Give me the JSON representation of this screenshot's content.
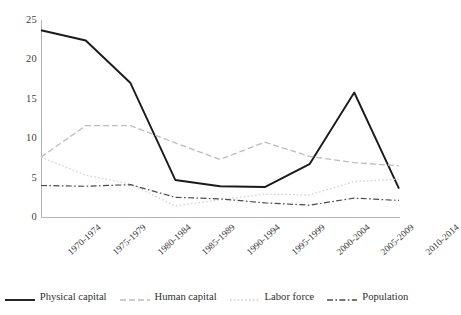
{
  "chart_data": {
    "type": "line",
    "title": "",
    "subtitle": "",
    "xlabel": "",
    "ylabel": "",
    "grid": false,
    "legend_position": "bottom",
    "ylim": [
      0,
      25
    ],
    "yticks": [
      0,
      5,
      10,
      15,
      20,
      25
    ],
    "categories": [
      "1970-1974",
      "1975-1979",
      "1980-1984",
      "1985-1989",
      "1990-1994",
      "1995-1999",
      "2000-2004",
      "2005-2009",
      "2010-2014"
    ],
    "series": [
      {
        "name": "Physical capital",
        "style": "solid",
        "color": "#1a1a1a",
        "width": 1.9,
        "values": [
          23.7,
          22.4,
          17.0,
          4.7,
          3.9,
          3.8,
          6.7,
          15.8,
          3.6
        ]
      },
      {
        "name": "Human capital",
        "style": "dashed",
        "color": "#bdbdbd",
        "width": 1.3,
        "values": [
          7.6,
          11.6,
          11.6,
          9.4,
          7.3,
          9.5,
          7.7,
          6.9,
          6.5
        ]
      },
      {
        "name": "Labor force",
        "style": "dotted",
        "color": "#cfcfcf",
        "width": 1.2,
        "values": [
          7.6,
          5.3,
          4.2,
          1.4,
          2.2,
          2.9,
          2.8,
          4.5,
          4.8
        ]
      },
      {
        "name": "Population",
        "style": "dash-dot",
        "color": "#4a4a4a",
        "width": 1.2,
        "values": [
          4.0,
          3.9,
          4.1,
          2.5,
          2.3,
          1.8,
          1.5,
          2.4,
          2.1
        ]
      }
    ]
  },
  "legend": {
    "items": [
      {
        "label": "Physical capital"
      },
      {
        "label": "Human capital"
      },
      {
        "label": "Labor force"
      },
      {
        "label": "Population"
      }
    ]
  },
  "axes": {
    "y_tick_labels": [
      "25",
      "20",
      "15",
      "10",
      "5",
      "0"
    ],
    "x_tick_labels": [
      "1970-1974",
      "1975-1979",
      "1980-1984",
      "1985-1989",
      "1990-1994",
      "1995-1999",
      "2000-2004",
      "2005-2009",
      "2010-2014"
    ]
  }
}
